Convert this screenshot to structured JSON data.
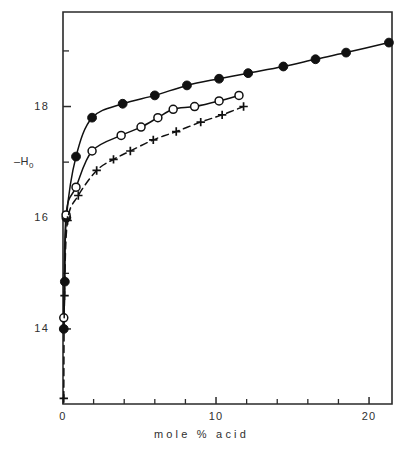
{
  "chart_data": {
    "type": "scatter",
    "title": "",
    "subtitle": "",
    "xlabel": "mole % acid",
    "ylabel": "-H₀",
    "ylabel_main": "–H",
    "ylabel_sub": "0",
    "xlim": [
      0,
      21.5
    ],
    "ylim": [
      12.65,
      19.7
    ],
    "grid": false,
    "legend": "none",
    "x_ticks_labeled": [
      0,
      10,
      20
    ],
    "x_tick_labels": [
      "0",
      "10",
      "20"
    ],
    "x_ticks_minor": [
      2,
      4,
      6,
      8,
      12,
      14,
      16,
      18
    ],
    "y_ticks_labeled": [
      14,
      16,
      18
    ],
    "y_tick_labels": [
      "14",
      "16",
      "18"
    ],
    "y_ticks_minor": [
      15,
      17,
      19
    ],
    "series": [
      {
        "name": "filled-circle-series",
        "marker": "filled-circle",
        "line": "solid",
        "color": "#111111",
        "x": [
          0.05,
          0.12,
          0.22,
          0.85,
          1.9,
          3.9,
          6.0,
          8.1,
          10.2,
          12.1,
          14.4,
          16.5,
          18.5,
          21.3
        ],
        "y": [
          14.0,
          14.85,
          16.0,
          17.1,
          17.8,
          18.05,
          18.2,
          18.38,
          18.5,
          18.6,
          18.72,
          18.85,
          18.97,
          19.15
        ]
      },
      {
        "name": "open-circle-series",
        "marker": "open-circle",
        "line": "solid",
        "color": "#111111",
        "x": [
          0.05,
          0.2,
          0.85,
          1.9,
          3.8,
          5.1,
          6.2,
          7.2,
          8.6,
          10.2,
          11.5
        ],
        "y": [
          14.2,
          16.05,
          16.55,
          17.2,
          17.48,
          17.63,
          17.8,
          17.95,
          18.0,
          18.1,
          18.2
        ]
      },
      {
        "name": "plus-series",
        "marker": "plus",
        "line": "dashed",
        "color": "#111111",
        "x": [
          0.05,
          0.1,
          0.3,
          1.0,
          2.2,
          3.3,
          4.4,
          5.9,
          7.4,
          9.0,
          10.4,
          11.8
        ],
        "y": [
          12.75,
          14.6,
          15.95,
          16.4,
          16.85,
          17.05,
          17.2,
          17.4,
          17.55,
          17.72,
          17.85,
          18.0
        ]
      }
    ]
  },
  "axes": {
    "frame_color": "#2a2a2a"
  }
}
